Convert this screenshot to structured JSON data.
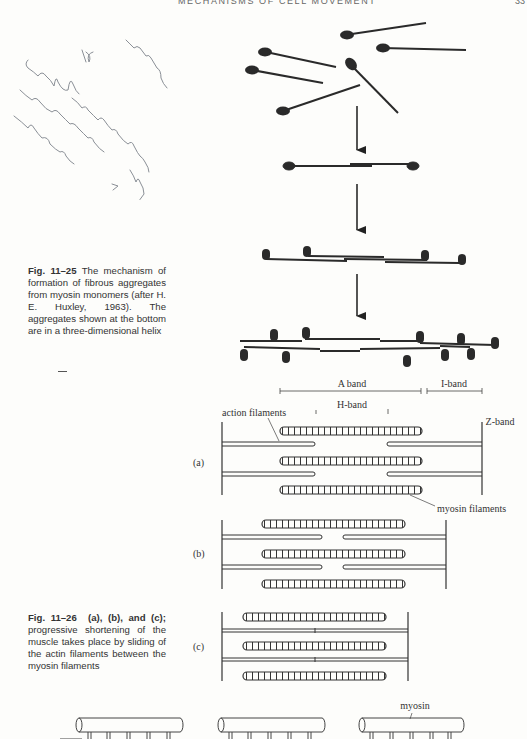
{
  "header": {
    "running_title": "MECHANISMS OF CELL MOVEMENT",
    "page_number": "33"
  },
  "handwritten_note": {
    "lines": [
      "muscle",
      "IV.",
      "cell regular helical",
      "conglomeration by",
      "explained ?"
    ]
  },
  "figure_11_25": {
    "label": "Fig. 11–25",
    "caption": "The mechanism of formation of fibrous aggregates from myosin monomers (after H. E. Huxley, 1963). The aggregates shown at the bottom are in a three-dimensional helix",
    "stages": [
      "monomers",
      "dimer",
      "small aggregate",
      "helical aggregate"
    ]
  },
  "figure_11_26": {
    "label": "Fig. 11–26",
    "caption_bold": "(a), (b), and (c);",
    "caption": "progressive shortening of the muscle takes place by sliding of the actin filaments between the myosin filaments",
    "bands": {
      "a_band": "A band",
      "i_band": "I-band",
      "h_band": "H-band",
      "z_band": "Z-band"
    },
    "labels": {
      "actin": "action filaments",
      "myosin": "myosin filaments",
      "panel_a": "(a)",
      "panel_b": "(b)",
      "panel_c": "(c)"
    }
  },
  "figure_bottom": {
    "label_myosin": "myosin"
  }
}
